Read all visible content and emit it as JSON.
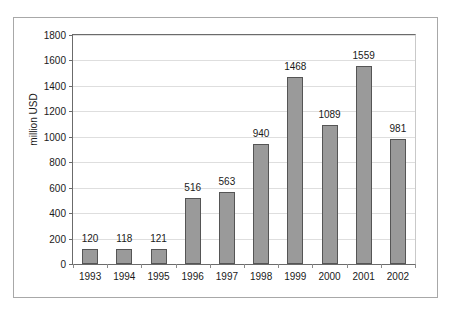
{
  "chart_data": {
    "type": "bar",
    "title": "",
    "subtitle": "",
    "xlabel": "",
    "ylabel": "million USD",
    "categories": [
      "1993",
      "1994",
      "1995",
      "1996",
      "1997",
      "1998",
      "1999",
      "2000",
      "2001",
      "2002"
    ],
    "values": [
      120,
      118,
      121,
      516,
      563,
      940,
      1468,
      1089,
      1559,
      981
    ],
    "data_labels": [
      "120",
      "118",
      "121",
      "516",
      "563",
      "940",
      "1468",
      "1089",
      "1559",
      "981"
    ],
    "ylim": [
      0,
      1800
    ],
    "ytick_labels": [
      "0",
      "200",
      "400",
      "600",
      "800",
      "1000",
      "1200",
      "1400",
      "1600",
      "1800"
    ],
    "ytick_values": [
      0,
      200,
      400,
      600,
      800,
      1000,
      1200,
      1400,
      1600,
      1800
    ],
    "grid": "horizontal",
    "legend": "none",
    "series": [
      {
        "name": "million USD",
        "values": [
          120,
          118,
          121,
          516,
          563,
          940,
          1468,
          1089,
          1559,
          981
        ]
      }
    ],
    "colors": {
      "bar_fill": "#9a9a9a",
      "bar_border": "#555555",
      "gridline": "#dedede",
      "axis": "#6b6b6b",
      "frame": "#a8a8a8",
      "text": "#1a1a1a",
      "background": "#ffffff"
    }
  }
}
